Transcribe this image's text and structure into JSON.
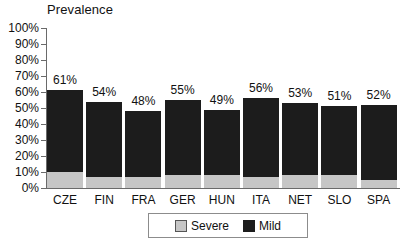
{
  "chart_data": {
    "type": "bar",
    "title": "Prevalence",
    "subtitle": "",
    "xlabel": "",
    "ylabel": "",
    "stacked": true,
    "grid": false,
    "legend_position": "bottom",
    "ylim": [
      0,
      100
    ],
    "ytick_labels": [
      "100%",
      "90%",
      "80%",
      "70%",
      "60%",
      "50%",
      "40%",
      "30%",
      "20%",
      "10%",
      "0%"
    ],
    "ytick_values": [
      100,
      90,
      80,
      70,
      60,
      50,
      40,
      30,
      20,
      10,
      0
    ],
    "categories": [
      "CZE",
      "FIN",
      "FRA",
      "GER",
      "HUN",
      "ITA",
      "NET",
      "SLO",
      "SPA"
    ],
    "series": [
      {
        "name": "Severe",
        "color": "#c6c6c6",
        "values": [
          10,
          7,
          7,
          8,
          8,
          7,
          8,
          8,
          5
        ]
      },
      {
        "name": "Mild",
        "color": "#1c1c1c",
        "values": [
          51,
          47,
          41,
          47,
          41,
          49,
          45,
          43,
          47
        ]
      }
    ],
    "totals": [
      61,
      54,
      48,
      55,
      49,
      56,
      53,
      51,
      52
    ],
    "data_labels": [
      "61%",
      "54%",
      "48%",
      "55%",
      "49%",
      "56%",
      "53%",
      "51%",
      "52%"
    ]
  },
  "legend": {
    "items": [
      {
        "label": "Severe",
        "swatch": "severe-swatch"
      },
      {
        "label": "Mild",
        "swatch": "mild-swatch"
      }
    ]
  }
}
